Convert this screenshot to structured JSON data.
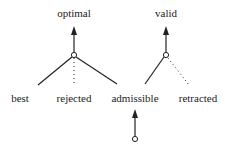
{
  "diagram": {
    "top_labels": {
      "optimal": "optimal",
      "valid": "valid"
    },
    "bottom_labels": {
      "best": "best",
      "rejected": "rejected",
      "admissible": "admissible",
      "retracted": "retracted"
    },
    "colors": {
      "line": "#222222",
      "background": "#ffffff"
    }
  }
}
